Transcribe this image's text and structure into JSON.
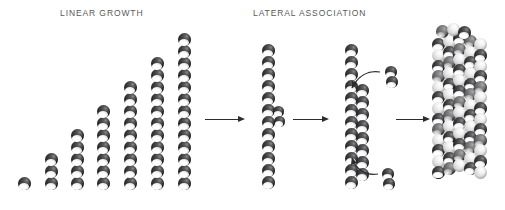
{
  "figure": {
    "background_color": "#ffffff",
    "bead_color": "#3a3a3c",
    "highlight_color": "#ffffff",
    "arrow_color": "#2c2c2e",
    "label_color": "#58585a",
    "type": "process-diagram"
  },
  "labels": {
    "linear_growth": "LINEAR GROWTH",
    "lateral_association": "LATERAL ASSOCIATION"
  },
  "linear_growth_series": {
    "caption": "LINEAR GROWTH",
    "description": "Seven successive filaments, each two subunits longer than the last, aligned on a common baseline",
    "bead_counts": [
      1,
      3,
      5,
      7,
      9,
      11,
      13
    ],
    "column_x": [
      18,
      45,
      71,
      97,
      124,
      151,
      178
    ],
    "baseline_y": 190,
    "bead_diameter": 13,
    "bead_pitch": 12
  },
  "stages": [
    {
      "name": "single-filament",
      "label": "single protofilament with a nucleating dimer on its side",
      "main_bead_count": 12,
      "side_bead_count": 2,
      "x": 262,
      "top_y": 44
    },
    {
      "name": "double-filament",
      "label": "two protofilaments associating laterally, free dimers adding",
      "strand_bead_counts": [
        12,
        8
      ],
      "free_dimers": 2,
      "curved_arrows": 2,
      "x": 345,
      "top_y": 44
    },
    {
      "name": "bundle",
      "label": "thick mature filament bundle of many subunits",
      "columns": 5,
      "rows": 13,
      "x": 432,
      "top_y": 32
    }
  ],
  "arrows": [
    {
      "name": "arrow-1",
      "from": "linear-growth-series",
      "to": "single-filament",
      "x": 205,
      "y": 116,
      "length": 40
    },
    {
      "name": "arrow-2",
      "from": "single-filament",
      "to": "double-filament",
      "x": 293,
      "y": 116,
      "length": 36
    },
    {
      "name": "arrow-3",
      "from": "double-filament",
      "to": "bundle",
      "x": 396,
      "y": 116,
      "length": 34
    }
  ],
  "free_subunits": [
    {
      "name": "free-dimer-top",
      "x": 385,
      "y": 66,
      "beads": 2,
      "joins": "double-filament upper region"
    },
    {
      "name": "free-dimer-bottom",
      "x": 382,
      "y": 168,
      "beads": 2,
      "joins": "double-filament lower region"
    }
  ]
}
